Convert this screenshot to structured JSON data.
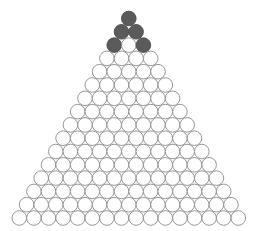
{
  "figure": {
    "background_color": "#ffffff"
  },
  "geometry": {
    "rows": 16,
    "bottom_row_count": 16,
    "total_circles": 136,
    "circle_diameter": 14.6,
    "circle_radius": 7.3,
    "horizontal_spacing": 14.6,
    "vertical_spacing": 13.3,
    "bottom_row_first_center_x": 19.3,
    "bottom_row_center_y": 218.0,
    "row_x_offset": 7.3
  },
  "style": {
    "dark_fill": "#5b5b5b",
    "dark_stroke": "#4a4a4a",
    "light_fill": "#ffffff",
    "light_stroke": "#8a8a8a",
    "stroke_width": 0.9
  },
  "chart_data": {
    "type": "diagram",
    "rows": [
      {
        "index": 1,
        "count": 1,
        "states": [
          "dark"
        ]
      },
      {
        "index": 2,
        "count": 2,
        "states": [
          "dark",
          "dark"
        ]
      },
      {
        "index": 3,
        "count": 3,
        "states": [
          "dark",
          "light",
          "dark"
        ]
      },
      {
        "index": 4,
        "count": 4,
        "states": [
          "light",
          "light",
          "light",
          "light"
        ]
      },
      {
        "index": 5,
        "count": 5,
        "states": [
          "light",
          "light",
          "light",
          "light",
          "light"
        ]
      },
      {
        "index": 6,
        "count": 6,
        "states": [
          "light",
          "light",
          "light",
          "light",
          "light",
          "light"
        ]
      },
      {
        "index": 7,
        "count": 7,
        "states": [
          "light",
          "light",
          "light",
          "light",
          "light",
          "light",
          "light"
        ]
      },
      {
        "index": 8,
        "count": 8,
        "states": [
          "light",
          "light",
          "light",
          "light",
          "light",
          "light",
          "light",
          "light"
        ]
      },
      {
        "index": 9,
        "count": 9,
        "states": [
          "light",
          "light",
          "light",
          "light",
          "light",
          "light",
          "light",
          "light",
          "light"
        ]
      },
      {
        "index": 10,
        "count": 10,
        "states": [
          "light",
          "light",
          "light",
          "light",
          "light",
          "light",
          "light",
          "light",
          "light",
          "light"
        ]
      },
      {
        "index": 11,
        "count": 11,
        "states": [
          "light",
          "light",
          "light",
          "light",
          "light",
          "light",
          "light",
          "light",
          "light",
          "light",
          "light"
        ]
      },
      {
        "index": 12,
        "count": 12,
        "states": [
          "light",
          "light",
          "light",
          "light",
          "light",
          "light",
          "light",
          "light",
          "light",
          "light",
          "light",
          "light"
        ]
      },
      {
        "index": 13,
        "count": 13,
        "states": [
          "light",
          "light",
          "light",
          "light",
          "light",
          "light",
          "light",
          "light",
          "light",
          "light",
          "light",
          "light",
          "light"
        ]
      },
      {
        "index": 14,
        "count": 14,
        "states": [
          "light",
          "light",
          "light",
          "light",
          "light",
          "light",
          "light",
          "light",
          "light",
          "light",
          "light",
          "light",
          "light",
          "light"
        ]
      },
      {
        "index": 15,
        "count": 15,
        "states": [
          "light",
          "light",
          "light",
          "light",
          "light",
          "light",
          "light",
          "light",
          "light",
          "light",
          "light",
          "light",
          "light",
          "light",
          "light"
        ]
      },
      {
        "index": 16,
        "count": 16,
        "states": [
          "light",
          "light",
          "light",
          "light",
          "light",
          "light",
          "light",
          "light",
          "light",
          "light",
          "light",
          "light",
          "light",
          "light",
          "light",
          "light"
        ]
      }
    ],
    "dark_count": 5,
    "light_count": 131
  }
}
